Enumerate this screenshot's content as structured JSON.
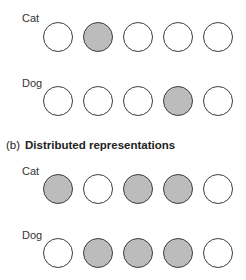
{
  "section_a": {
    "rows": [
      {
        "label": "Cat",
        "units": [
          0,
          1,
          0,
          0,
          0
        ]
      },
      {
        "label": "Dog",
        "units": [
          0,
          0,
          0,
          1,
          0
        ]
      }
    ]
  },
  "section_b": {
    "prefix": "(b)",
    "title": "Distributed representations",
    "rows": [
      {
        "label": "Cat",
        "units": [
          1,
          0,
          1,
          1,
          0
        ]
      },
      {
        "label": "Dog",
        "units": [
          0,
          1,
          1,
          1,
          0
        ]
      }
    ]
  },
  "colors": {
    "active_fill": "#bcbcbc",
    "inactive_fill": "#ffffff",
    "stroke": "#3c3c3c"
  }
}
